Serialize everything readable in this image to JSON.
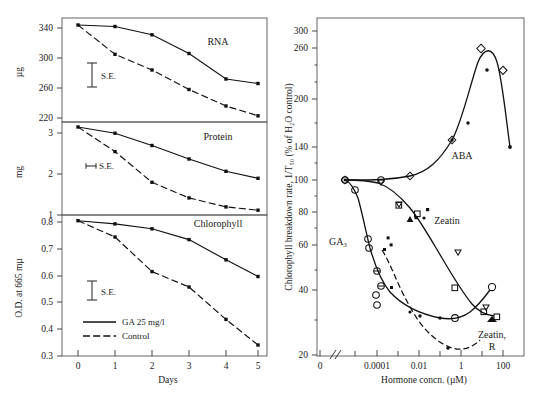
{
  "figure": {
    "left_panel": {
      "xaxis": {
        "label": "Days",
        "ticks": [
          "0",
          "1",
          "2",
          "3",
          "4",
          "5"
        ],
        "min": 0,
        "max": 5
      },
      "legend": [
        {
          "label": "GA 25 mg/l",
          "style": "solid"
        },
        {
          "label": "Control",
          "style": "dashed"
        }
      ],
      "se_label": "S.E.",
      "panels": [
        {
          "name": "RNA",
          "ylabel": "µg",
          "yticks": [
            "340",
            "300",
            "260",
            "220"
          ],
          "ylim": [
            220,
            360
          ],
          "series": [
            {
              "name": "GA 25 mg/l",
              "style": "solid",
              "x": [
                0,
                1,
                2,
                3,
                4,
                5
              ],
              "values": [
                350,
                348,
                337,
                312,
                278,
                272
              ]
            },
            {
              "name": "Control",
              "style": "dashed",
              "x": [
                0,
                1,
                2,
                3,
                4,
                5
              ],
              "values": [
                350,
                311,
                290,
                264,
                242,
                229
              ]
            }
          ]
        },
        {
          "name": "Protein",
          "ylabel": "mg",
          "yticks": [
            "3",
            "2",
            "1"
          ],
          "ylim": [
            1.0,
            3.55
          ],
          "series": [
            {
              "name": "GA 25 mg/l",
              "style": "solid",
              "x": [
                0,
                1,
                2,
                3,
                4,
                5
              ],
              "values": [
                3.45,
                3.3,
                3.0,
                2.67,
                2.37,
                2.2
              ]
            },
            {
              "name": "Control",
              "style": "dashed",
              "x": [
                0,
                1,
                2,
                3,
                4,
                5
              ],
              "values": [
                3.45,
                2.85,
                2.1,
                1.72,
                1.5,
                1.42
              ]
            }
          ]
        },
        {
          "name": "Chlorophyll",
          "ylabel": "O.D. at 665 mµ",
          "yticks": [
            "0.8",
            "0.7",
            "0.6",
            "0.5",
            "0.4",
            "0.3"
          ],
          "ylim": [
            0.3,
            0.82
          ],
          "series": [
            {
              "name": "GA 25 mg/l",
              "style": "solid",
              "x": [
                0,
                1,
                2,
                3,
                4,
                5
              ],
              "values": [
                0.805,
                0.793,
                0.775,
                0.735,
                0.66,
                0.598
              ]
            },
            {
              "name": "Control",
              "style": "dashed",
              "x": [
                0,
                1,
                2,
                3,
                4,
                5
              ],
              "values": [
                0.805,
                0.745,
                0.617,
                0.56,
                0.44,
                0.345
              ]
            }
          ]
        }
      ]
    },
    "right_panel": {
      "ylabel": "Chlorophyll breakdown rate, 1/T₅₀ (% of H₂O control)",
      "xlabel": "Hormone concn. (µM)",
      "yticks": [
        "300",
        "260",
        "200",
        "140",
        "100",
        "80",
        "60",
        "40",
        "20"
      ],
      "xticks": [
        "0",
        "0.0001",
        "0.01",
        "1",
        "100"
      ],
      "axis_break": "//",
      "curve_labels": [
        {
          "text": "ABA"
        },
        {
          "text": "GA₃"
        },
        {
          "text": "Zeatin"
        },
        {
          "text": "Zeatin,"
        },
        {
          "text": "R"
        }
      ],
      "curves": [
        {
          "name": "ABA",
          "marker": "diamond-open",
          "x": [
            0,
            0.0001,
            0.01,
            1,
            10,
            100,
            300,
            1000
          ],
          "values": [
            100,
            100,
            100,
            120,
            148,
            265,
            215,
            143
          ]
        },
        {
          "name": "ABA-filled",
          "marker": "dot-filled",
          "x": [
            10,
            30,
            100,
            1000
          ],
          "values": [
            148,
            170,
            210,
            143
          ]
        },
        {
          "name": "GA3",
          "marker": "circle-open",
          "x": [
            0,
            0.0001,
            0.001,
            0.01,
            0.03,
            0.1,
            1,
            10,
            100,
            300
          ],
          "values": [
            100,
            93,
            66,
            59,
            38,
            35,
            30,
            27,
            27,
            29
          ]
        },
        {
          "name": "Zeatin",
          "marker": "triangle-down-open",
          "x": [
            0,
            0.0001,
            0.01,
            0.1,
            1,
            10,
            100,
            300
          ],
          "values": [
            100,
            100,
            86,
            79,
            73,
            47,
            31,
            29
          ]
        },
        {
          "name": "Zeatin-square",
          "marker": "square-open",
          "x": [
            0.01,
            1,
            10,
            100,
            300
          ],
          "values": [
            79,
            72,
            41,
            31,
            29
          ]
        },
        {
          "name": "Zeatin-R",
          "marker": "circle-half",
          "style": "dashed",
          "x": [
            0.01,
            0.03,
            0.1,
            1,
            10,
            100,
            300
          ],
          "values": [
            44,
            42,
            38,
            50,
            30,
            21,
            25
          ]
        }
      ]
    },
    "caption": ""
  }
}
